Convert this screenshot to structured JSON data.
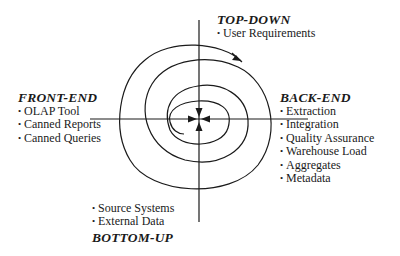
{
  "diagram": {
    "type": "spiral",
    "colors": {
      "stroke": "#1a1a1a",
      "text": "#1a1a1a",
      "background": "#ffffff"
    },
    "center": {
      "x": 199,
      "y": 120
    },
    "quadrants": {
      "top": {
        "heading": "TOP-DOWN",
        "items": [
          "User Requirements"
        ]
      },
      "front": {
        "heading": "FRONT-END",
        "items": [
          "OLAP Tool",
          "Canned Reports",
          "Canned Queries"
        ]
      },
      "back": {
        "heading": "BACK-END",
        "items": [
          "Extraction",
          "Integration",
          "Quality Assurance",
          "Warehouse Load",
          "Aggregates",
          "Metadata"
        ]
      },
      "bottom": {
        "heading": "BOTTOM-UP",
        "items": [
          "Source Systems",
          "External Data"
        ]
      }
    },
    "bullet": "•"
  }
}
